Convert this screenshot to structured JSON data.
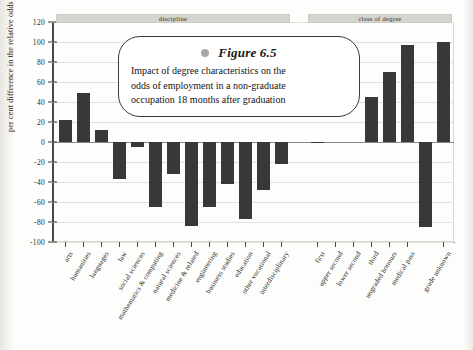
{
  "caption": {
    "bullet_icon": "bullet-dot-icon",
    "title": "Figure 6.5",
    "line1": "Impact of degree characteristics on the",
    "line2": "odds of employment in a non-graduate",
    "line3": "occupation 18 months after graduation"
  },
  "chart_data": {
    "type": "bar",
    "title": "Figure 6.5",
    "subtitle": "Impact of degree characteristics on the odds of employment in a non-graduate occupation 18 months after graduation",
    "xlabel": "",
    "ylabel": "per cent difference in the relative odds",
    "ylim": [
      -100,
      120
    ],
    "ytick_values": [
      120,
      100,
      80,
      60,
      40,
      20,
      0,
      -20,
      -40,
      -60,
      -80,
      -100
    ],
    "ytick_labels": [
      "120",
      "100",
      "80",
      "60",
      "40",
      "20",
      "0",
      "-20",
      "-40",
      "-60",
      "-80",
      "-100"
    ],
    "grid": true,
    "legend": "none",
    "bar_color": "#3a3836",
    "groups": [
      {
        "name": "discipline",
        "categories": [
          "arts",
          "humanities",
          "languages",
          "law",
          "social sciences",
          "mathematics & computing",
          "natural sciences",
          "medicine & related",
          "engineering",
          "business studies",
          "education",
          "other vocational",
          "interdisciplinary"
        ],
        "values": [
          22,
          49,
          12,
          -37,
          -5,
          -65,
          -32,
          -84,
          -65,
          -42,
          -77,
          -48,
          -22
        ]
      },
      {
        "name": "class of degree",
        "categories": [
          "first",
          "upper second",
          "lower second",
          "third",
          "ungraded honours",
          "medical pass",
          "grade unknown"
        ],
        "values": [
          -1,
          0,
          0,
          45,
          70,
          97,
          100
        ]
      }
    ],
    "extra_bars": [
      {
        "after_category": "medical pass",
        "value": -85,
        "note": "downward bar plotted between medical pass and grade unknown"
      }
    ]
  }
}
